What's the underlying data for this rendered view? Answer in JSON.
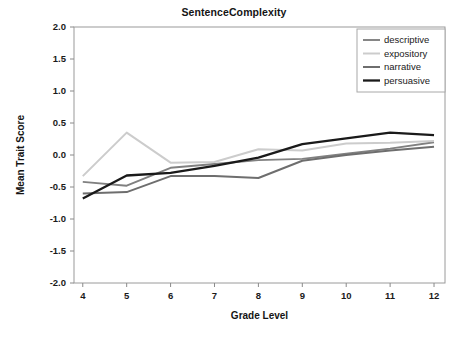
{
  "chart_data": {
    "type": "line",
    "title": "SentenceComplexity",
    "xlabel": "Grade Level",
    "ylabel": "Mean Trait Score",
    "x": [
      4,
      5,
      6,
      7,
      8,
      9,
      10,
      11,
      12
    ],
    "categories": [
      "4",
      "5",
      "6",
      "7",
      "8",
      "9",
      "10",
      "11",
      "12"
    ],
    "xlim": [
      3.8,
      12.25
    ],
    "ylim": [
      -2.0,
      2.0
    ],
    "yticks": [
      2.0,
      1.5,
      1.0,
      0.5,
      0.0,
      -0.5,
      -1.0,
      -1.5,
      -2.0
    ],
    "ytick_labels": [
      "2.0",
      "1.5",
      "1.0",
      "0.5",
      "0.0",
      "-0.5",
      "-1.0",
      "-1.5",
      "-2.0"
    ],
    "grid": false,
    "legend_position": "top-right",
    "series": [
      {
        "name": "descriptive",
        "color": "#808080",
        "width": 1.9,
        "values": [
          -0.42,
          -0.48,
          -0.2,
          -0.14,
          -0.08,
          -0.06,
          0.02,
          0.1,
          0.2
        ]
      },
      {
        "name": "expository",
        "color": "#cccccc",
        "width": 2.0,
        "values": [
          -0.33,
          0.35,
          -0.12,
          -0.11,
          0.09,
          0.07,
          0.18,
          0.19,
          0.22
        ]
      },
      {
        "name": "narrative",
        "color": "#6e6e6e",
        "width": 2.0,
        "values": [
          -0.6,
          -0.58,
          -0.33,
          -0.33,
          -0.36,
          -0.09,
          0.0,
          0.07,
          0.13
        ]
      },
      {
        "name": "persuasive",
        "color": "#1a1a1a",
        "width": 2.3,
        "values": [
          -0.68,
          -0.32,
          -0.28,
          -0.17,
          -0.04,
          0.17,
          0.26,
          0.35,
          0.31
        ]
      }
    ]
  },
  "legend": {
    "items": [
      {
        "label": "descriptive"
      },
      {
        "label": "expository"
      },
      {
        "label": "narrative"
      },
      {
        "label": "persuasive"
      }
    ]
  }
}
